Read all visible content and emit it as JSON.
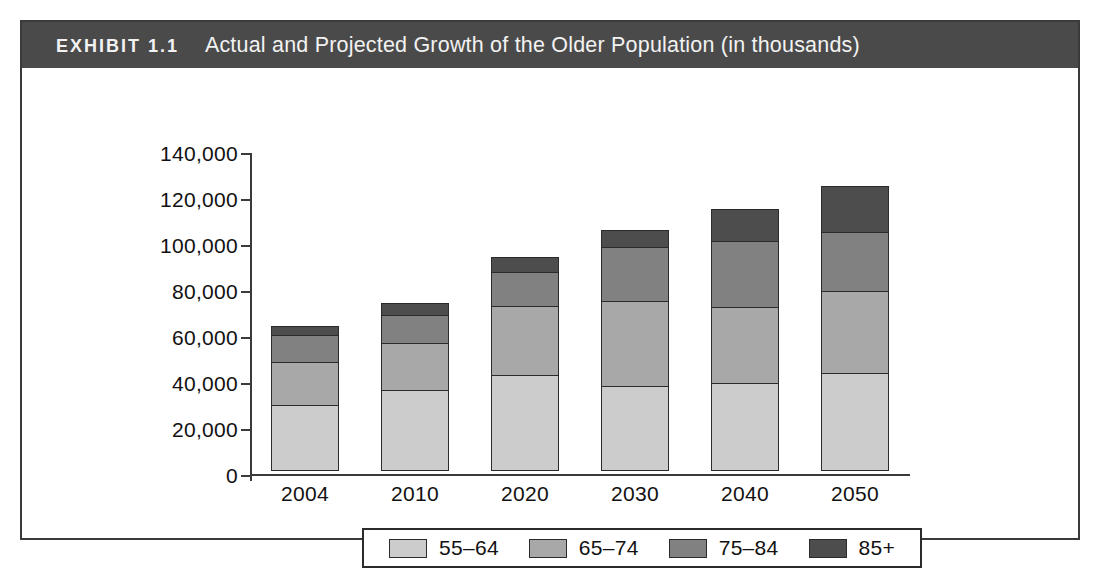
{
  "exhibit": {
    "label": "EXHIBIT 1.1",
    "title": "Actual and Projected Growth of the Older Population (in thousands)",
    "header_bg": "#4a4a4a",
    "header_text_color": "#f2f2f2",
    "frame_color": "#3a3a3a"
  },
  "chart_data": {
    "type": "bar",
    "stacked": true,
    "title": "Actual and Projected Growth of the Older Population (in thousands)",
    "xlabel": "",
    "ylabel": "",
    "ylim": [
      0,
      140000
    ],
    "ytick_step": 20000,
    "ytick_labels": [
      "140,000",
      "120,000",
      "100,000",
      "80,000",
      "60,000",
      "40,000",
      "20,000",
      "0"
    ],
    "ytick_values": [
      140000,
      120000,
      100000,
      80000,
      60000,
      40000,
      20000,
      0
    ],
    "grid": false,
    "legend_position": "bottom",
    "categories": [
      "2004",
      "2010",
      "2020",
      "2030",
      "2040",
      "2050"
    ],
    "series": [
      {
        "name": "55–64",
        "color": "#cccccc",
        "values": [
          29000,
          35500,
          41700,
          37200,
          38500,
          42700
        ]
      },
      {
        "name": "65–74",
        "color": "#a8a8a8",
        "values": [
          19000,
          20800,
          30800,
          37300,
          33500,
          36300
        ]
      },
      {
        "name": "75–84",
        "color": "#818181",
        "values": [
          12500,
          13000,
          15500,
          24500,
          29300,
          26300
        ]
      },
      {
        "name": "85+",
        "color": "#4d4d4d",
        "values": [
          4800,
          5900,
          7200,
          7800,
          14600,
          20700
        ]
      }
    ],
    "totals": [
      65300,
      75200,
      95200,
      106800,
      115900,
      126000
    ]
  },
  "legend": {
    "items": [
      {
        "label": "55–64",
        "color": "#cccccc"
      },
      {
        "label": "65–74",
        "color": "#a8a8a8"
      },
      {
        "label": "75–84",
        "color": "#818181"
      },
      {
        "label": "85+",
        "color": "#4d4d4d"
      }
    ]
  }
}
